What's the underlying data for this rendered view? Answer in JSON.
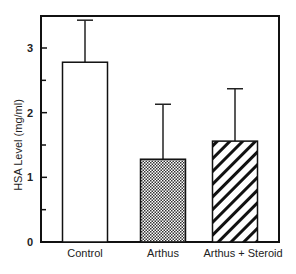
{
  "chart_data": {
    "type": "bar",
    "title": "",
    "xlabel": "",
    "ylabel": "HSA Level (mg/ml)",
    "ylim": [
      0,
      3.5
    ],
    "yticks": [
      0,
      1,
      2,
      3
    ],
    "yminor_ticks": [
      0.5,
      1.5,
      2.5
    ],
    "categories": [
      "Control",
      "Arthus",
      "Arthus  +  Steroid"
    ],
    "values": [
      2.78,
      1.28,
      1.56
    ],
    "error_upper": [
      0.65,
      0.85,
      0.81
    ],
    "patterns": [
      "none",
      "crosshatch-dots",
      "diagonal-stripes"
    ],
    "grid": false,
    "legend": "none"
  }
}
